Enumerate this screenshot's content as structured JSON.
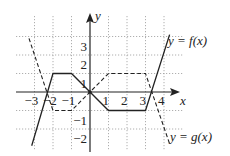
{
  "chart_data": {
    "type": "line",
    "title": "",
    "xlabel": "x",
    "ylabel": "y",
    "xlim": [
      -3.4,
      4.8
    ],
    "ylim": [
      -3.1,
      4.2
    ],
    "grid": true,
    "x_ticks": [
      -3,
      -2,
      -1,
      1,
      2,
      3,
      4
    ],
    "y_ticks": [
      -2,
      -1,
      1,
      2,
      3
    ],
    "x_tick_labels": [
      "−3",
      "−2",
      "−1",
      "1",
      "2",
      "3",
      "4"
    ],
    "y_tick_labels": [
      "−2",
      "−1",
      "1",
      "2",
      "3"
    ],
    "series": [
      {
        "name": "y = f(x)",
        "style": "solid",
        "points": [
          [
            -3.15,
            -2.9
          ],
          [
            -2,
            1
          ],
          [
            -1,
            1
          ],
          [
            1,
            -1
          ],
          [
            3,
            -1
          ],
          [
            4.3,
            3.1
          ]
        ]
      },
      {
        "name": "y = g(x)",
        "style": "dashed",
        "points": [
          [
            -3.3,
            2.9
          ],
          [
            -2,
            -1
          ],
          [
            -1,
            -1
          ],
          [
            1,
            1
          ],
          [
            3,
            1
          ],
          [
            4.3,
            -2.8
          ]
        ]
      }
    ],
    "annotations": [
      {
        "text": "y = f(x)",
        "near": [
          4.3,
          3.1
        ]
      },
      {
        "text": "y = g(x)",
        "near": [
          4.3,
          -2.8
        ]
      }
    ]
  },
  "labels": {
    "x_axis": "x",
    "y_axis": "y",
    "f_label": "y = f(x)",
    "g_label": "y = g(x)",
    "xticks": [
      "−3",
      "−2",
      "−1",
      "1",
      "2",
      "3",
      "4"
    ],
    "yticks": [
      "3",
      "2",
      "1",
      "−1",
      "−2"
    ]
  },
  "colors": {
    "line": "#222222",
    "grid": "#9a9a9a"
  }
}
